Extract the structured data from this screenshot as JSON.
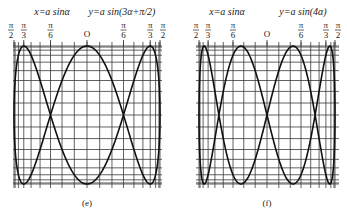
{
  "figure": {
    "panels": [
      {
        "id": "e",
        "caption": "(e)",
        "x_equation": "x=a sinα",
        "y_equation": "y=a sin(3α+π/2)",
        "y_multiplier": 3,
        "y_phase": 1.5707963,
        "center_x": 87,
        "half_width": 73,
        "center_y": 115,
        "half_height": 69,
        "grid_left": 13,
        "grid_right": 162,
        "caption_x": 87
      },
      {
        "id": "f",
        "caption": "(f)",
        "x_equation": "x=a sinα",
        "y_equation": "y=a sin(4α)",
        "y_multiplier": 4,
        "y_phase": 0,
        "center_x": 267,
        "half_width": 68,
        "center_y": 115,
        "half_height": 69,
        "grid_left": 196,
        "grid_right": 339,
        "caption_x": 267
      }
    ],
    "axis_ticks": [
      {
        "label_num": "π",
        "label_den": "2",
        "angle_deg": -90
      },
      {
        "label_num": "π",
        "label_den": "3",
        "angle_deg": -60
      },
      {
        "label_num": "π",
        "label_den": "6",
        "angle_deg": -30
      },
      {
        "label": "O",
        "angle_deg": 0
      },
      {
        "label_num": "π",
        "label_den": "6",
        "angle_deg": 30
      },
      {
        "label_num": "π",
        "label_den": "3",
        "angle_deg": 60
      },
      {
        "label_num": "π",
        "label_den": "2",
        "angle_deg": 90
      }
    ],
    "grid_step_deg": 10,
    "colors": {
      "grid": "#3a3a3a",
      "curve": "#111111",
      "text": "#222222"
    }
  }
}
